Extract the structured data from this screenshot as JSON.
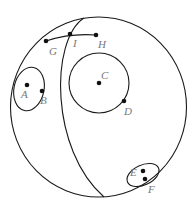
{
  "diagram": {
    "colors": {
      "stroke": "#1a1a1a",
      "point": "#111111",
      "label": "#777777",
      "background": "#ffffff"
    },
    "outer_circle": {
      "cx": 98.5,
      "cy": 107,
      "rx": 88,
      "ry": 90
    },
    "meridian_arc": "M 84 18 C 50 40, 50 150, 104 197",
    "top_curve": "M 46 41 Q 70 33 96 35",
    "ellipse_ab": {
      "cx": 29,
      "cy": 89,
      "rx": 15,
      "ry": 22,
      "rotate": 12
    },
    "circle_c": {
      "cx": 99,
      "cy": 83,
      "r": 30
    },
    "ellipse_ef": {
      "cx": 143,
      "cy": 175,
      "rx": 17,
      "ry": 10,
      "rotate": -25
    },
    "points": [
      {
        "id": "G",
        "label": "G",
        "x": 46,
        "y": 41,
        "lx": 49,
        "ly": 55
      },
      {
        "id": "I",
        "label": "I",
        "x": 70,
        "y": 34,
        "lx": 73,
        "ly": 47
      },
      {
        "id": "H",
        "label": "H",
        "x": 96,
        "y": 35,
        "lx": 98,
        "ly": 48
      },
      {
        "id": "A",
        "label": "A",
        "x": 27,
        "y": 85,
        "lx": 21,
        "ly": 98
      },
      {
        "id": "B",
        "label": "B",
        "x": 42,
        "y": 91,
        "lx": 40,
        "ly": 104
      },
      {
        "id": "C",
        "label": "C",
        "x": 99,
        "y": 83,
        "lx": 101,
        "ly": 79
      },
      {
        "id": "D",
        "label": "D",
        "x": 124,
        "y": 101,
        "lx": 124,
        "ly": 115
      },
      {
        "id": "E",
        "label": "E",
        "x": 143,
        "y": 171,
        "lx": 130,
        "ly": 176
      },
      {
        "id": "F",
        "label": "F",
        "x": 145,
        "y": 179,
        "lx": 148,
        "ly": 193
      }
    ]
  }
}
